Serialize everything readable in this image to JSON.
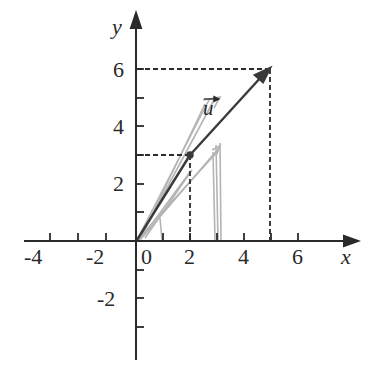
{
  "diagram": {
    "type": "coordinate-plane-vector",
    "axes": {
      "x_label": "x",
      "y_label": "y",
      "x_ticks": [
        "-4",
        "-2",
        "0",
        "2",
        "4",
        "6"
      ],
      "y_ticks_positive": [
        "2",
        "4",
        "6"
      ],
      "y_ticks_negative": [
        "-2"
      ]
    },
    "vector": {
      "label": "u",
      "start": [
        2,
        3
      ],
      "end": [
        5,
        6
      ],
      "color": "#3a3a3a"
    },
    "guide_points": [
      {
        "x": 2,
        "y": 3
      },
      {
        "x": 5,
        "y": 6
      }
    ],
    "sketch_color": "#a8a8a8",
    "axis_color": "#2a2a2a"
  }
}
